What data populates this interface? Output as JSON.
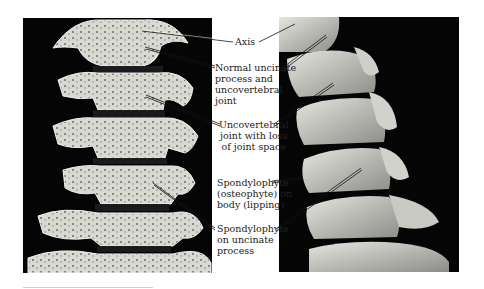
{
  "figure": {
    "panels": [
      {
        "id": "left",
        "view": "anterior-3d-ct-cervical-spine"
      },
      {
        "id": "right",
        "view": "lateral-3d-ct-cervical-spine"
      }
    ],
    "labels": [
      {
        "id": "axis",
        "text": "Axis"
      },
      {
        "id": "normal-uncinate",
        "text": "Normal uncinate\nprocess and\nuncovertebral\njoint"
      },
      {
        "id": "uncovertebral-loss",
        "text": "Uncovertebral\njoint with loss\nof joint space"
      },
      {
        "id": "spondylophyte-body",
        "text": "Spondylophyte\n(osteophyte) on\nbody (lipping)"
      },
      {
        "id": "spondylophyte-uncinate",
        "text": "Spondylophyte\non uncinate\nprocess"
      }
    ],
    "colors": {
      "background": "#ffffff",
      "panel": "#050505",
      "bone": "#d8d8d0",
      "text": "#222222"
    }
  }
}
